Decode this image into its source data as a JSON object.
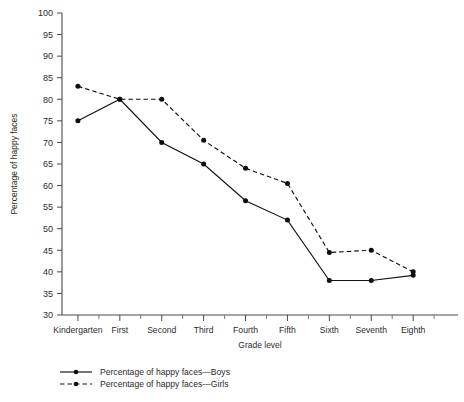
{
  "chart_data": {
    "type": "line",
    "title": "",
    "subtitle": "",
    "xlabel": "Grade level",
    "ylabel": "Percentage of happy faces",
    "categories": [
      "Kindergarten",
      "First",
      "Second",
      "Third",
      "Fourth",
      "Fifth",
      "Sixth",
      "Seventh",
      "Eighth"
    ],
    "ylim": [
      30,
      100
    ],
    "ytick_step": 5,
    "yticks": [
      30,
      35,
      40,
      45,
      50,
      55,
      60,
      65,
      70,
      75,
      80,
      85,
      90,
      95,
      100
    ],
    "ytick_labels": [
      "30",
      "35",
      "40",
      "45",
      "50",
      "55",
      "60",
      "65",
      "70",
      "75",
      "80",
      "85",
      "90",
      "95",
      "100"
    ],
    "grid": false,
    "legend_position": "below-left",
    "minor_ticks_between_categories": true,
    "series": [
      {
        "name": "Percentage of happy faces—Boys",
        "style": "solid",
        "marker": "filled-circle",
        "color": "#111111",
        "values": [
          75,
          80,
          70,
          65,
          56.5,
          52,
          38,
          38,
          39.2
        ]
      },
      {
        "name": "Percentage of happy faces—Girls",
        "style": "dashed",
        "marker": "filled-circle",
        "color": "#111111",
        "values": [
          83,
          80,
          80,
          70.5,
          64,
          60.5,
          44.5,
          45,
          40
        ]
      }
    ]
  },
  "legend": {
    "items": [
      {
        "label": "Percentage of happy faces—Boys",
        "style": "solid"
      },
      {
        "label": "Percentage of happy faces—Girls",
        "style": "dashed"
      }
    ]
  }
}
